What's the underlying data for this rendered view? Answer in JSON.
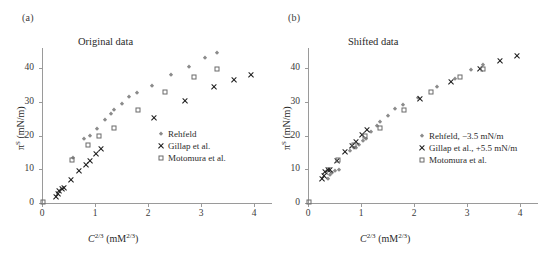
{
  "figure": {
    "panels": [
      {
        "tag": "(a)",
        "title": "Original data",
        "xlabel_main": "C",
        "xlabel_sup": "2/3",
        "xlabel_unit_open": " (mM",
        "xlabel_unit_sup": "2/3",
        "xlabel_unit_close": ")",
        "ylabel_main": "π",
        "ylabel_sup": "S",
        "ylabel_unit": " (mN/m)",
        "xticks": [
          "0",
          "1",
          "2",
          "3",
          "4"
        ],
        "yticks": [
          "0",
          "10",
          "20",
          "30",
          "40"
        ],
        "legend": [
          {
            "label": "Rehfeld",
            "marker": "rehfeld"
          },
          {
            "label": "Gillap et al.",
            "marker": "gillap"
          },
          {
            "label": "Motomura et al.",
            "marker": "motomura"
          }
        ]
      },
      {
        "tag": "(b)",
        "title": "Shifted data",
        "xlabel_main": "C",
        "xlabel_sup": "2/3",
        "xlabel_unit_open": " (mM",
        "xlabel_unit_sup": "2/3",
        "xlabel_unit_close": ")",
        "ylabel_main": "π",
        "ylabel_sup": "S",
        "ylabel_unit": " (mN/m)",
        "xticks": [
          "0",
          "1",
          "2",
          "3",
          "4"
        ],
        "yticks": [
          "0",
          "10",
          "20",
          "30",
          "40"
        ],
        "legend": [
          {
            "label": "Rehfeld, −3.5 mN/m",
            "marker": "rehfeld"
          },
          {
            "label": "Gillap et al., +5.5 mN/m",
            "marker": "gillap"
          },
          {
            "label": "Motomura et al.",
            "marker": "motomura"
          }
        ]
      }
    ]
  },
  "chart_data": [
    {
      "type": "scatter",
      "panel": "(a)",
      "title": "Original data",
      "xlabel": "C^2/3 (mM^2/3)",
      "ylabel": "π^S (mN/m)",
      "xlim": [
        0,
        4.15
      ],
      "ylim": [
        0,
        46
      ],
      "xticks": [
        0,
        1,
        2,
        3,
        4
      ],
      "yticks": [
        0,
        10,
        20,
        30,
        40
      ],
      "grid": false,
      "legend_position": "inside-right",
      "series": [
        {
          "name": "Rehfeld",
          "marker": "diamond",
          "color": "#8b8b8b",
          "points": [
            [
              0.58,
              13.3
            ],
            [
              0.79,
              18.9
            ],
            [
              0.9,
              19.9
            ],
            [
              1.03,
              21.9
            ],
            [
              1.18,
              24.7
            ],
            [
              1.3,
              26.4
            ],
            [
              1.36,
              27.5
            ],
            [
              1.5,
              29.4
            ],
            [
              1.64,
              31.4
            ],
            [
              1.8,
              32.7
            ],
            [
              2.08,
              34.6
            ],
            [
              2.44,
              38.0
            ],
            [
              2.78,
              40.3
            ],
            [
              3.08,
              43.0
            ],
            [
              3.3,
              44.5
            ]
          ]
        },
        {
          "name": "Gillap et al.",
          "marker": "x",
          "color": "#1a1a1a",
          "points": [
            [
              0.26,
              1.7
            ],
            [
              0.3,
              2.6
            ],
            [
              0.33,
              3.6
            ],
            [
              0.37,
              4.2
            ],
            [
              0.41,
              4.4
            ],
            [
              0.55,
              6.9
            ],
            [
              0.7,
              9.5
            ],
            [
              0.83,
              11.3
            ],
            [
              0.9,
              12.6
            ],
            [
              1.02,
              14.6
            ],
            [
              1.12,
              16.1
            ],
            [
              2.12,
              25.3
            ],
            [
              2.7,
              30.3
            ],
            [
              3.25,
              34.4
            ],
            [
              3.62,
              36.6
            ],
            [
              3.94,
              38.1
            ]
          ]
        },
        {
          "name": "Motomura et al.",
          "marker": "square",
          "color": "#6a6a6a",
          "points": [
            [
              0.02,
              0.2
            ],
            [
              0.57,
              12.7
            ],
            [
              0.86,
              17.2
            ],
            [
              1.08,
              20.0
            ],
            [
              1.35,
              22.3
            ],
            [
              1.81,
              27.5
            ],
            [
              2.32,
              32.9
            ],
            [
              2.86,
              37.3
            ],
            [
              3.3,
              39.8
            ]
          ]
        }
      ]
    },
    {
      "type": "scatter",
      "panel": "(b)",
      "title": "Shifted data",
      "xlabel": "C^2/3 (mM^2/3)",
      "ylabel": "π^S (mN/m)",
      "xlim": [
        0,
        4.15
      ],
      "ylim": [
        0,
        46
      ],
      "xticks": [
        0,
        1,
        2,
        3,
        4
      ],
      "yticks": [
        0,
        10,
        20,
        30,
        40
      ],
      "grid": false,
      "legend_position": "inside-right",
      "series": [
        {
          "name": "Rehfeld, −3.5 mN/m",
          "marker": "diamond",
          "color": "#8b8b8b",
          "points": [
            [
              0.38,
              7.2
            ],
            [
              0.42,
              8.2
            ],
            [
              0.46,
              9.0
            ],
            [
              0.5,
              9.6
            ],
            [
              0.58,
              9.8
            ],
            [
              0.79,
              15.4
            ],
            [
              0.86,
              16.2
            ],
            [
              0.9,
              16.4
            ],
            [
              0.96,
              17.2
            ],
            [
              1.03,
              18.4
            ],
            [
              1.1,
              19.0
            ],
            [
              1.18,
              21.2
            ],
            [
              1.3,
              22.9
            ],
            [
              1.36,
              24.0
            ],
            [
              1.5,
              25.9
            ],
            [
              1.64,
              27.9
            ],
            [
              1.8,
              29.2
            ],
            [
              2.08,
              31.1
            ],
            [
              2.44,
              34.5
            ],
            [
              2.78,
              36.8
            ],
            [
              3.08,
              39.5
            ],
            [
              3.3,
              41.0
            ]
          ]
        },
        {
          "name": "Gillap et al., +5.5 mN/m",
          "marker": "x",
          "color": "#1a1a1a",
          "points": [
            [
              0.26,
              7.2
            ],
            [
              0.3,
              8.1
            ],
            [
              0.33,
              9.1
            ],
            [
              0.37,
              9.7
            ],
            [
              0.41,
              9.9
            ],
            [
              0.55,
              12.4
            ],
            [
              0.7,
              15.0
            ],
            [
              0.83,
              16.8
            ],
            [
              0.9,
              18.1
            ],
            [
              1.02,
              20.1
            ],
            [
              1.12,
              21.6
            ],
            [
              2.12,
              30.8
            ],
            [
              2.7,
              35.8
            ],
            [
              3.25,
              39.9
            ],
            [
              3.62,
              42.1
            ],
            [
              3.94,
              43.6
            ]
          ]
        },
        {
          "name": "Motomura et al.",
          "marker": "square",
          "color": "#6a6a6a",
          "points": [
            [
              0.02,
              0.2
            ],
            [
              0.57,
              12.7
            ],
            [
              0.86,
              17.2
            ],
            [
              1.08,
              20.0
            ],
            [
              1.35,
              22.3
            ],
            [
              1.81,
              27.5
            ],
            [
              2.32,
              32.9
            ],
            [
              2.86,
              37.3
            ],
            [
              3.3,
              39.8
            ]
          ]
        }
      ]
    }
  ]
}
